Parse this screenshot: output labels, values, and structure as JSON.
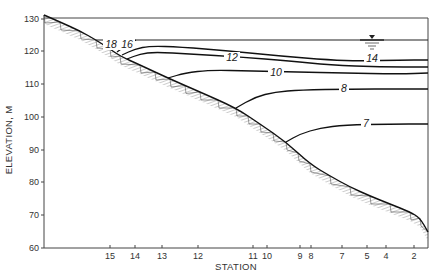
{
  "chart_data": {
    "type": "line",
    "title": "",
    "xlabel": "STATION",
    "ylabel": "ELEVATION, M",
    "ylim": [
      60,
      130
    ],
    "yticks": [
      130,
      120,
      110,
      100,
      90,
      80,
      70,
      60
    ],
    "stations": [
      "15",
      "14",
      "13",
      "12",
      "11",
      "10",
      "9",
      "8",
      "7",
      "5",
      "4",
      "2"
    ],
    "grid": false,
    "water_surface_elevation": 123.5,
    "bottom_profile": {
      "name": "Bed / sloping bottom (hatched)",
      "points_px": [
        [
          44,
          15
        ],
        [
          60,
          22
        ],
        [
          80,
          31
        ],
        [
          96,
          40
        ],
        [
          110,
          49
        ],
        [
          120,
          56
        ],
        [
          140,
          65
        ],
        [
          170,
          79
        ],
        [
          200,
          92
        ],
        [
          236,
          108
        ],
        [
          260,
          124
        ],
        [
          286,
          142
        ],
        [
          310,
          164
        ],
        [
          330,
          176
        ],
        [
          350,
          187
        ],
        [
          370,
          196
        ],
        [
          390,
          204
        ],
        [
          410,
          212
        ],
        [
          420,
          218
        ],
        [
          428,
          232
        ]
      ]
    },
    "series": [
      {
        "name": "18",
        "label": "18",
        "label_px": [
          111,
          48
        ],
        "points_px": [
          [
            104,
            46
          ],
          [
            112,
            42
          ],
          [
            118,
            40
          ]
        ]
      },
      {
        "name": "16",
        "label": "16",
        "label_px": [
          127,
          48
        ],
        "points_px": [
          [
            117,
            52
          ],
          [
            128,
            44
          ],
          [
            136,
            40
          ]
        ]
      },
      {
        "name": "14",
        "label": "14",
        "label_px": [
          372,
          62
        ],
        "points_px": [
          [
            122,
            55
          ],
          [
            135,
            49
          ],
          [
            150,
            46
          ],
          [
            180,
            47
          ],
          [
            230,
            51
          ],
          [
            280,
            56
          ],
          [
            330,
            60
          ],
          [
            360,
            61
          ],
          [
            400,
            60
          ],
          [
            428,
            60
          ]
        ]
      },
      {
        "name": "12",
        "label": "12",
        "label_px": [
          232,
          61
        ],
        "points_px": [
          [
            127,
            59
          ],
          [
            140,
            54
          ],
          [
            155,
            52
          ],
          [
            190,
            54
          ],
          [
            240,
            57
          ],
          [
            290,
            61
          ],
          [
            330,
            65
          ],
          [
            380,
            67
          ],
          [
            428,
            67
          ]
        ]
      },
      {
        "name": "10",
        "label": "10",
        "label_px": [
          276,
          76
        ],
        "points_px": [
          [
            168,
            78
          ],
          [
            185,
            73
          ],
          [
            210,
            70
          ],
          [
            250,
            71
          ],
          [
            300,
            72
          ],
          [
            340,
            73
          ],
          [
            400,
            74
          ],
          [
            428,
            73
          ]
        ]
      },
      {
        "name": "8",
        "label": "8",
        "label_px": [
          344,
          92
        ],
        "points_px": [
          [
            236,
            108
          ],
          [
            255,
            97
          ],
          [
            275,
            92
          ],
          [
            300,
            90
          ],
          [
            350,
            89
          ],
          [
            400,
            89
          ],
          [
            428,
            89
          ]
        ]
      },
      {
        "name": "7",
        "label": "7",
        "label_px": [
          366,
          127
        ],
        "points_px": [
          [
            286,
            142
          ],
          [
            300,
            134
          ],
          [
            320,
            128
          ],
          [
            345,
            125
          ],
          [
            390,
            124
          ],
          [
            428,
            124
          ]
        ]
      }
    ],
    "axis_px": {
      "x_left": 44,
      "x_right": 428,
      "y_top": 18,
      "y_bottom": 248,
      "ytick_px": [
        19,
        51,
        84,
        117,
        150,
        182,
        215,
        248
      ],
      "station_px": [
        110,
        135,
        162,
        198,
        253,
        267,
        300,
        311,
        342,
        367,
        386,
        414
      ]
    },
    "water_surface_px": {
      "y": 40,
      "x_start": 96,
      "x_end": 428,
      "symbol_x": 372
    }
  }
}
